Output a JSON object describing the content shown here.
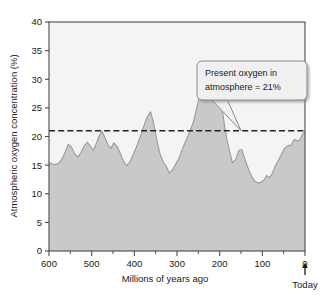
{
  "chart_data": {
    "type": "area",
    "title": "",
    "xlabel": "Millions of years ago",
    "ylabel": "Atmospheric oxygen concentration (%)",
    "xlim": [
      600,
      0
    ],
    "ylim": [
      0,
      40
    ],
    "x_reversed": true,
    "grid": false,
    "legend": null,
    "x_ticks": [
      "600",
      "500",
      "400",
      "300",
      "200",
      "100",
      "0"
    ],
    "x_tick_values": [
      600,
      500,
      400,
      300,
      200,
      100,
      0
    ],
    "x_minor_tick_values": [
      550,
      450,
      350,
      250,
      150,
      50
    ],
    "y_ticks": [
      "0",
      "5",
      "10",
      "15",
      "20",
      "25",
      "30",
      "35",
      "40"
    ],
    "y_tick_values": [
      0,
      5,
      10,
      15,
      20,
      25,
      30,
      35,
      40
    ],
    "series": [
      {
        "name": "Atmospheric oxygen concentration",
        "x": [
          600,
          592,
          585,
          578,
          570,
          562,
          555,
          548,
          540,
          532,
          525,
          518,
          510,
          503,
          496,
          490,
          483,
          476,
          470,
          462,
          455,
          448,
          440,
          432,
          425,
          418,
          410,
          403,
          396,
          390,
          383,
          376,
          370,
          362,
          355,
          348,
          340,
          332,
          325,
          318,
          310,
          303,
          296,
          290,
          283,
          276,
          270,
          262,
          255,
          248,
          240,
          232,
          225,
          218,
          210,
          203,
          196,
          190,
          183,
          176,
          170,
          162,
          155,
          148,
          140,
          132,
          125,
          118,
          110,
          103,
          96,
          90,
          83,
          76,
          70,
          62,
          55,
          48,
          40,
          32,
          25,
          18,
          12,
          6,
          0
        ],
        "y": [
          15.4,
          15.2,
          15.1,
          15.3,
          16.0,
          17.3,
          18.6,
          18.2,
          17.0,
          16.4,
          17.2,
          18.3,
          19.0,
          18.3,
          17.6,
          18.6,
          20.0,
          20.9,
          20.0,
          18.6,
          17.9,
          18.9,
          18.2,
          16.9,
          15.6,
          14.9,
          15.6,
          16.8,
          18.0,
          19.2,
          20.6,
          22.2,
          23.4,
          24.3,
          22.4,
          19.6,
          17.0,
          15.5,
          14.8,
          13.6,
          14.2,
          15.2,
          16.1,
          17.3,
          18.6,
          19.8,
          20.9,
          22.4,
          24.6,
          26.8,
          28.4,
          29.6,
          30.4,
          30.3,
          29.6,
          28.4,
          26.0,
          22.6,
          19.4,
          17.2,
          15.4,
          16.0,
          17.6,
          17.7,
          15.8,
          14.2,
          13.0,
          12.2,
          11.9,
          12.0,
          12.4,
          13.2,
          12.8,
          13.6,
          14.8,
          15.9,
          16.9,
          17.9,
          18.4,
          18.5,
          19.5,
          19.2,
          19.4,
          20.4,
          20.9
        ]
      }
    ],
    "reference_line": {
      "label": "Present oxygen in atmosphere",
      "value": 21,
      "style": "dashed",
      "orientation": "horizontal"
    },
    "annotations": [
      {
        "name": "callout",
        "line1": "Present oxygen in",
        "line2": "atmosphere = 21%",
        "points_to_x": 150,
        "points_to_y": 21
      },
      {
        "name": "today-marker",
        "text": "Today",
        "at_x": 0
      }
    ],
    "colors": {
      "fill": "#c9c9c9",
      "line": "#9a9a9a",
      "plot_background": "#f4f4f4",
      "axis": "#4a4a4a",
      "reference_line": "#222222",
      "callout_background": "#f0f0f0",
      "callout_border": "#8a8a8a",
      "text": "#1a1a1a"
    }
  }
}
